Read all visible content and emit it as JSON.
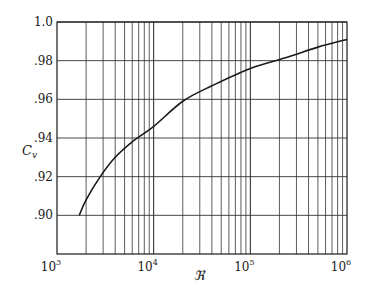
{
  "chart_data": {
    "type": "line",
    "title": "",
    "xlabel": "ℜ",
    "ylabel": "C_v",
    "xscale": "log",
    "xlim": [
      1000,
      1000000
    ],
    "ylim": [
      0.88,
      1.0
    ],
    "grid": true,
    "legend": null,
    "x_tick_labels": [
      {
        "value": 1000,
        "base": "10",
        "exp": "3"
      },
      {
        "value": 10000,
        "base": "10",
        "exp": "4"
      },
      {
        "value": 100000,
        "base": "10",
        "exp": "5"
      },
      {
        "value": 1000000,
        "base": "10",
        "exp": "6"
      }
    ],
    "y_tick_labels": [
      {
        "value": 1.0,
        "label": "1.0"
      },
      {
        "value": 0.98,
        "label": ".98"
      },
      {
        "value": 0.96,
        "label": ".96"
      },
      {
        "value": 0.94,
        "label": ".94"
      },
      {
        "value": 0.92,
        "label": ".92"
      },
      {
        "value": 0.9,
        "label": ".90"
      }
    ],
    "series": [
      {
        "name": "C_v vs Reynolds number",
        "x": [
          1700,
          2000,
          2800,
          4000,
          6000,
          10000,
          20000,
          40000,
          100000,
          250000,
          500000,
          1000000
        ],
        "y": [
          0.9,
          0.908,
          0.92,
          0.93,
          0.938,
          0.946,
          0.959,
          0.967,
          0.976,
          0.982,
          0.987,
          0.991
        ]
      }
    ]
  },
  "axes": {
    "y_label_main": "C",
    "y_label_sub": "v",
    "x_label": "ℜ"
  }
}
